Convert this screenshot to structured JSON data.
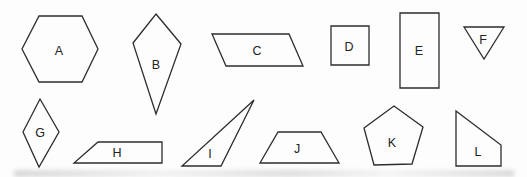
{
  "figure": {
    "background_color": "#fdfdfd",
    "stroke_color": "#2d2d2d",
    "stroke_width": 1.3,
    "label_color": "#222222",
    "label_font_size": 12.5,
    "canvas_width": 527,
    "canvas_height": 177,
    "shapes": [
      {
        "label": "A",
        "type": "hexagon",
        "points": [
          [
            39,
            16
          ],
          [
            82,
            16
          ],
          [
            98,
            49
          ],
          [
            82,
            82
          ],
          [
            39,
            82
          ],
          [
            22,
            49
          ]
        ],
        "label_pos": [
          59,
          50
        ]
      },
      {
        "label": "B",
        "type": "kite",
        "points": [
          [
            156,
            14
          ],
          [
            181,
            44
          ],
          [
            156,
            114
          ],
          [
            133,
            43
          ]
        ],
        "label_pos": [
          156,
          64
        ]
      },
      {
        "label": "C",
        "type": "parallelogram",
        "points": [
          [
            212,
            34
          ],
          [
            289,
            34
          ],
          [
            303,
            66
          ],
          [
            226,
            66
          ]
        ],
        "label_pos": [
          257,
          50
        ]
      },
      {
        "label": "D",
        "type": "square",
        "points": [
          [
            331,
            26
          ],
          [
            369,
            26
          ],
          [
            369,
            65
          ],
          [
            331,
            65
          ]
        ],
        "label_pos": [
          349,
          46
        ]
      },
      {
        "label": "E",
        "type": "rectangle",
        "points": [
          [
            400,
            13
          ],
          [
            439,
            13
          ],
          [
            439,
            88
          ],
          [
            400,
            88
          ]
        ],
        "label_pos": [
          419,
          50
        ]
      },
      {
        "label": "F",
        "type": "triangle-down",
        "points": [
          [
            464,
            27
          ],
          [
            504,
            27
          ],
          [
            484,
            59
          ]
        ],
        "label_pos": [
          483,
          39
        ]
      },
      {
        "label": "G",
        "type": "rhombus",
        "points": [
          [
            40,
            99
          ],
          [
            59,
            132
          ],
          [
            39,
            167
          ],
          [
            23,
            132
          ]
        ],
        "label_pos": [
          40,
          132
        ]
      },
      {
        "label": "H",
        "type": "right-trapezoid",
        "points": [
          [
            98,
            142
          ],
          [
            162,
            142
          ],
          [
            162,
            163
          ],
          [
            74,
            163
          ]
        ],
        "label_pos": [
          117,
          152
        ]
      },
      {
        "label": "I",
        "type": "scalene-triangle",
        "points": [
          [
            254,
            100
          ],
          [
            221,
            166
          ],
          [
            182,
            166
          ]
        ],
        "label_pos": [
          210,
          153
        ]
      },
      {
        "label": "J",
        "type": "isosceles-trapezoid",
        "points": [
          [
            278,
            132
          ],
          [
            321,
            132
          ],
          [
            339,
            163
          ],
          [
            260,
            163
          ]
        ],
        "label_pos": [
          297,
          148
        ]
      },
      {
        "label": "K",
        "type": "pentagon",
        "points": [
          [
            394,
            106
          ],
          [
            423,
            127
          ],
          [
            412,
            164
          ],
          [
            374,
            165
          ],
          [
            364,
            128
          ]
        ],
        "label_pos": [
          392,
          142
        ]
      },
      {
        "label": "L",
        "type": "right-trapezoid-vertical",
        "points": [
          [
            456,
            111
          ],
          [
            501,
            145
          ],
          [
            501,
            166
          ],
          [
            456,
            166
          ]
        ],
        "label_pos": [
          478,
          151
        ]
      }
    ]
  }
}
